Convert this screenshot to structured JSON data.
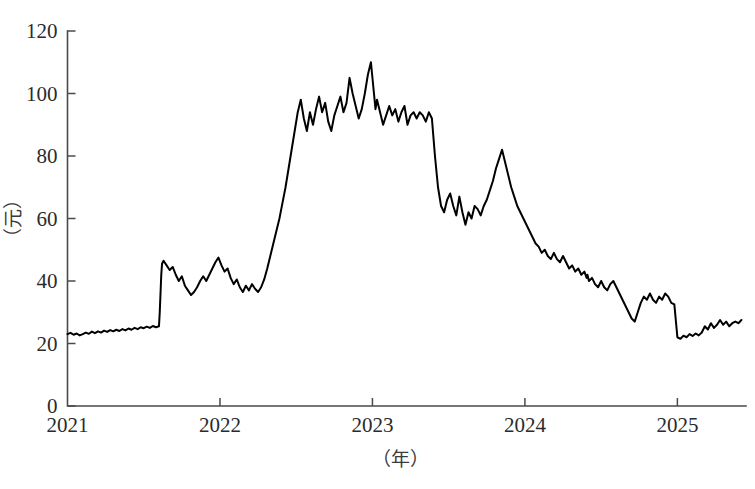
{
  "chart_data": {
    "type": "line",
    "title": "",
    "subtitle": "",
    "xlabel": "（年）",
    "ylabel": "（元）",
    "xlim": [
      2021.0,
      2025.45
    ],
    "ylim": [
      0,
      120
    ],
    "grid": false,
    "legend": null,
    "x_ticks": [
      "2021",
      "2022",
      "2023",
      "2024",
      "2025"
    ],
    "x_tick_values": [
      2021,
      2022,
      2023,
      2024,
      2025
    ],
    "y_ticks": [
      "0",
      "20",
      "40",
      "60",
      "80",
      "100",
      "120"
    ],
    "y_tick_values": [
      0,
      20,
      40,
      60,
      80,
      100,
      120
    ],
    "line_color": "#000000",
    "background_color": "#ffffff",
    "axis_color": "#4a4a4a",
    "series": [
      {
        "name": "price",
        "x": [
          2021.0,
          2021.02,
          2021.04,
          2021.06,
          2021.08,
          2021.1,
          2021.12,
          2021.14,
          2021.16,
          2021.18,
          2021.2,
          2021.22,
          2021.24,
          2021.26,
          2021.28,
          2021.3,
          2021.32,
          2021.34,
          2021.36,
          2021.38,
          2021.4,
          2021.42,
          2021.44,
          2021.46,
          2021.48,
          2021.5,
          2021.52,
          2021.54,
          2021.56,
          2021.58,
          2021.6,
          2021.605,
          2021.61,
          2021.615,
          2021.62,
          2021.63,
          2021.65,
          2021.67,
          2021.69,
          2021.71,
          2021.73,
          2021.75,
          2021.77,
          2021.79,
          2021.81,
          2021.83,
          2021.85,
          2021.87,
          2021.89,
          2021.91,
          2021.93,
          2021.95,
          2021.97,
          2021.99,
          2022.01,
          2022.03,
          2022.05,
          2022.07,
          2022.09,
          2022.11,
          2022.13,
          2022.15,
          2022.17,
          2022.19,
          2022.21,
          2022.23,
          2022.25,
          2022.27,
          2022.29,
          2022.31,
          2022.33,
          2022.35,
          2022.37,
          2022.39,
          2022.41,
          2022.43,
          2022.45,
          2022.47,
          2022.49,
          2022.51,
          2022.53,
          2022.55,
          2022.57,
          2022.59,
          2022.61,
          2022.63,
          2022.65,
          2022.67,
          2022.69,
          2022.71,
          2022.73,
          2022.75,
          2022.77,
          2022.79,
          2022.81,
          2022.83,
          2022.85,
          2022.87,
          2022.89,
          2022.91,
          2022.93,
          2022.95,
          2022.97,
          2022.99,
          2023.01,
          2023.02,
          2023.03,
          2023.05,
          2023.07,
          2023.09,
          2023.11,
          2023.13,
          2023.15,
          2023.17,
          2023.19,
          2023.21,
          2023.23,
          2023.25,
          2023.27,
          2023.29,
          2023.31,
          2023.33,
          2023.35,
          2023.37,
          2023.39,
          2023.41,
          2023.43,
          2023.45,
          2023.47,
          2023.49,
          2023.51,
          2023.53,
          2023.55,
          2023.57,
          2023.59,
          2023.61,
          2023.63,
          2023.65,
          2023.67,
          2023.69,
          2023.71,
          2023.73,
          2023.75,
          2023.77,
          2023.79,
          2023.81,
          2023.83,
          2023.85,
          2023.87,
          2023.89,
          2023.91,
          2023.93,
          2023.95,
          2023.97,
          2023.99,
          2024.01,
          2024.03,
          2024.05,
          2024.07,
          2024.09,
          2024.11,
          2024.13,
          2024.15,
          2024.17,
          2024.19,
          2024.21,
          2024.23,
          2024.25,
          2024.27,
          2024.29,
          2024.31,
          2024.33,
          2024.35,
          2024.37,
          2024.39,
          2024.405,
          2024.41,
          2024.42,
          2024.44,
          2024.46,
          2024.48,
          2024.5,
          2024.52,
          2024.54,
          2024.56,
          2024.58,
          2024.6,
          2024.62,
          2024.64,
          2024.66,
          2024.68,
          2024.7,
          2024.72,
          2024.74,
          2024.76,
          2024.78,
          2024.8,
          2024.82,
          2024.84,
          2024.86,
          2024.88,
          2024.9,
          2024.92,
          2024.94,
          2024.96,
          2024.98,
          2025.0,
          2025.02,
          2025.04,
          2025.06,
          2025.08,
          2025.1,
          2025.12,
          2025.14,
          2025.16,
          2025.18,
          2025.2,
          2025.22,
          2025.24,
          2025.26,
          2025.28,
          2025.3,
          2025.32,
          2025.34,
          2025.36,
          2025.38,
          2025.4,
          2025.42
        ],
        "values": [
          23.0,
          23.4,
          22.8,
          23.2,
          22.6,
          23.0,
          23.5,
          23.1,
          23.8,
          23.3,
          23.9,
          23.5,
          24.1,
          23.7,
          24.3,
          23.9,
          24.4,
          24.0,
          24.6,
          24.2,
          24.8,
          24.4,
          25.0,
          24.6,
          25.2,
          24.9,
          25.4,
          25.0,
          25.6,
          25.2,
          25.5,
          30.0,
          36.0,
          42.0,
          45.5,
          46.5,
          45.0,
          43.5,
          44.5,
          42.0,
          40.0,
          41.5,
          38.5,
          37.0,
          35.5,
          36.5,
          38.0,
          40.0,
          41.5,
          40.0,
          42.0,
          44.0,
          46.0,
          47.5,
          45.0,
          43.0,
          44.0,
          41.0,
          39.0,
          40.5,
          38.0,
          36.5,
          38.5,
          37.0,
          39.0,
          37.5,
          36.5,
          38.0,
          40.5,
          44.0,
          48.0,
          52.0,
          56.0,
          60.0,
          65.0,
          70.0,
          76.0,
          82.0,
          88.0,
          94.0,
          98.0,
          92.0,
          88.0,
          94.0,
          90.0,
          95.0,
          99.0,
          94.0,
          97.0,
          91.0,
          88.0,
          93.0,
          96.0,
          99.0,
          94.0,
          97.0,
          105.0,
          100.0,
          96.0,
          92.0,
          95.0,
          100.0,
          106.0,
          110.0,
          100.0,
          95.0,
          98.0,
          94.0,
          90.0,
          93.0,
          96.0,
          93.0,
          95.0,
          91.0,
          94.0,
          96.0,
          90.0,
          93.0,
          94.0,
          92.0,
          94.0,
          93.0,
          91.0,
          94.0,
          92.0,
          80.0,
          70.0,
          64.0,
          62.0,
          66.0,
          68.0,
          64.0,
          61.0,
          67.0,
          62.0,
          58.0,
          62.0,
          60.0,
          64.0,
          63.0,
          61.0,
          64.0,
          66.0,
          69.0,
          72.0,
          76.0,
          79.0,
          82.0,
          78.0,
          74.0,
          70.0,
          67.0,
          64.0,
          62.0,
          60.0,
          58.0,
          56.0,
          54.0,
          52.0,
          51.0,
          49.0,
          50.0,
          48.0,
          47.0,
          49.0,
          47.0,
          46.0,
          48.0,
          46.0,
          44.0,
          45.0,
          43.0,
          44.0,
          42.0,
          43.0,
          41.0,
          42.0,
          40.0,
          41.0,
          39.0,
          38.0,
          40.0,
          38.0,
          37.0,
          39.0,
          40.0,
          38.0,
          36.0,
          34.0,
          32.0,
          30.0,
          28.0,
          27.0,
          30.0,
          33.0,
          35.0,
          34.0,
          36.0,
          34.0,
          33.0,
          35.0,
          34.0,
          36.0,
          35.0,
          33.0,
          32.5,
          22.0,
          21.5,
          22.5,
          22.0,
          23.0,
          22.4,
          23.2,
          22.6,
          23.5,
          25.5,
          24.5,
          26.5,
          25.0,
          26.0,
          27.5,
          26.0,
          27.0,
          25.5,
          26.5,
          27.0,
          26.5,
          27.5
        ]
      }
    ]
  },
  "axes": {
    "x_title": "（年）",
    "y_title": "（元）"
  }
}
